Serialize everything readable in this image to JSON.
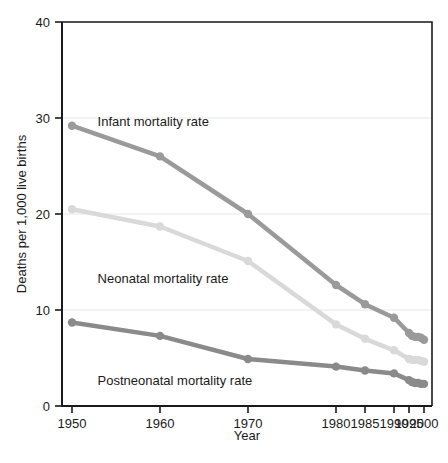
{
  "chart_data": {
    "type": "line",
    "title": "",
    "xlabel": "Year",
    "ylabel": "Deaths per 1,000 live births",
    "xlim": [
      1950,
      2000
    ],
    "ylim": [
      0,
      40
    ],
    "yticks": [
      0,
      10,
      20,
      30,
      40
    ],
    "ytick_labels": [
      "0",
      "10",
      "20",
      "30",
      "40"
    ],
    "xticks": [
      1950,
      1960,
      1970,
      1980,
      1985,
      1990,
      1995,
      2000
    ],
    "xtick_labels": [
      "1950",
      "1960",
      "1970",
      "1980",
      "1985",
      "1990",
      "1995",
      "2000"
    ],
    "grid": "horizontal",
    "legend_position": "inline-annotations",
    "series": [
      {
        "name": "Infant mortality rate",
        "color": "#9a9a9a",
        "label_x": 1952,
        "label_y": 29.6,
        "x": [
          1950,
          1960,
          1970,
          1980,
          1985,
          1990,
          1995,
          1996,
          1997,
          1998,
          1999,
          2000
        ],
        "values": [
          29.2,
          26.0,
          20.0,
          12.6,
          10.6,
          9.2,
          7.6,
          7.3,
          7.2,
          7.2,
          7.1,
          6.9
        ]
      },
      {
        "name": "Neonatal mortality rate",
        "color": "#d9d9d9",
        "label_x": 1952,
        "label_y": 13.2,
        "x": [
          1950,
          1960,
          1970,
          1980,
          1985,
          1990,
          1995,
          1996,
          1997,
          1998,
          1999,
          2000
        ],
        "values": [
          20.5,
          18.7,
          15.1,
          8.5,
          7.0,
          5.8,
          4.9,
          4.8,
          4.8,
          4.8,
          4.7,
          4.6
        ]
      },
      {
        "name": "Postneonatal mortality rate",
        "color": "#8a8a8a",
        "label_x": 1952,
        "label_y": 2.6,
        "x": [
          1950,
          1960,
          1970,
          1980,
          1985,
          1990,
          1995,
          1996,
          1997,
          1998,
          1999,
          2000
        ],
        "values": [
          8.7,
          7.3,
          4.9,
          4.1,
          3.7,
          3.4,
          2.7,
          2.5,
          2.4,
          2.4,
          2.3,
          2.3
        ]
      }
    ]
  }
}
